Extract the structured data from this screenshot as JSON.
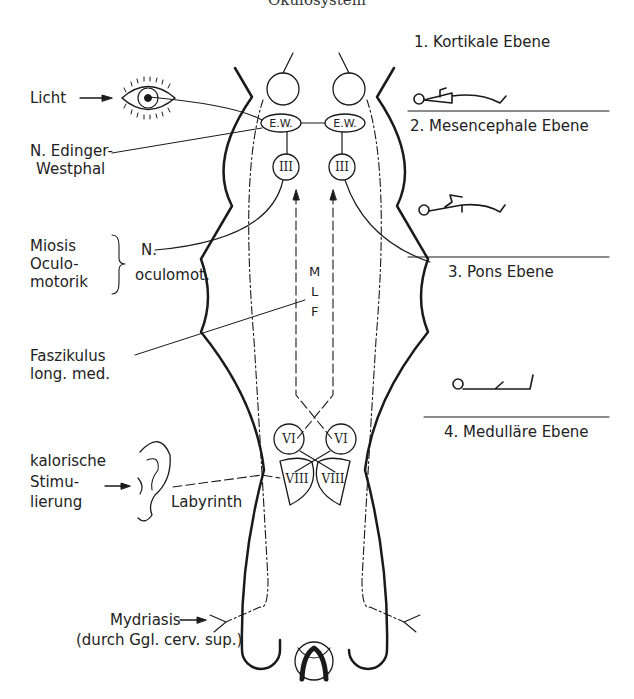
{
  "header": {
    "title": "Okulosystem"
  },
  "levels": [
    {
      "label": "1. Kortikale Ebene"
    },
    {
      "label": "2. Mesencephale Ebene"
    },
    {
      "label": "3. Pons Ebene"
    },
    {
      "label": "4. Medulläre Ebene"
    }
  ],
  "left_labels": {
    "licht": "Licht",
    "edinger_1": "N. Edinger-",
    "edinger_2": "Westphal",
    "miosis_1": "Miosis",
    "miosis_2": "Oculo-",
    "miosis_3": "motorik",
    "n_label": "N.",
    "oculomot": "oculomot.",
    "fasz_1": "Faszikulus",
    "fasz_2": "long. med.",
    "kal_1": "kalorische",
    "kal_2": "Stimu-",
    "kal_3": "lierung",
    "labyrinth": "Labyrinth",
    "mydriasis": "Mydriasis",
    "durch": "(durch Ggl. cerv. sup.)"
  },
  "center_labels": {
    "mlf": [
      "M",
      "L",
      "F"
    ],
    "ew": "E.W.",
    "n3": "III",
    "n6": "VI",
    "n8": "VIII"
  },
  "colors": {
    "ink": "#1a1a1a",
    "background": "#ffffff"
  }
}
